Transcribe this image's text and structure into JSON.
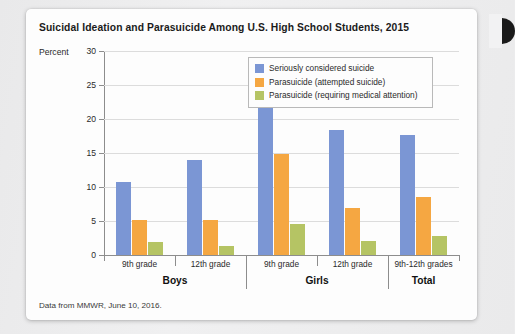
{
  "figure": {
    "title": "Suicidal Ideation and Parasuicide Among U.S. High School Students, 2015",
    "source_note": "Data from MMWR, June 10, 2016."
  },
  "chart_data": {
    "type": "bar",
    "title": "Suicidal Ideation and Parasuicide Among U.S. High School Students, 2015",
    "xlabel": "",
    "ylabel": "Percent",
    "ylim": [
      0,
      30
    ],
    "yticks": [
      0,
      5,
      10,
      15,
      20,
      25,
      30
    ],
    "grid": true,
    "legend_position": "upper-right-inside",
    "categories": [
      "9th grade",
      "12th grade",
      "9th grade",
      "12th grade",
      "9th-12th grades"
    ],
    "group_labels": [
      "Boys",
      "Girls",
      "Total"
    ],
    "group_spans": [
      2,
      2,
      1
    ],
    "series": [
      {
        "name": "Seriously considered suicide",
        "color": "#7b96d4",
        "values": [
          10.7,
          14.0,
          26.3,
          18.4,
          17.7
        ]
      },
      {
        "name": "Parasuicide (attempted suicide)",
        "color": "#f5a742",
        "values": [
          5.1,
          5.1,
          14.9,
          6.9,
          8.6
        ]
      },
      {
        "name": "Parasuicide (requiring medical attention)",
        "color": "#b5c464",
        "values": [
          1.9,
          1.3,
          4.6,
          2.0,
          2.8
        ]
      }
    ]
  }
}
